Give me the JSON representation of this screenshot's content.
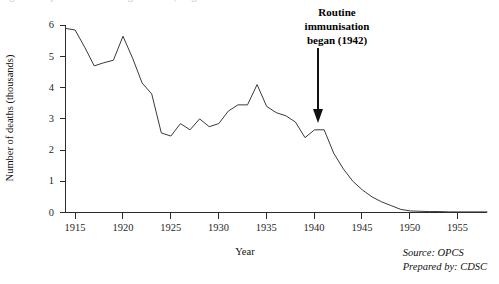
{
  "figure": {
    "clipped_top_caption": "Figure 1   Diphtheria: death registrations, England and Wales",
    "annotation": {
      "line1": "Routine",
      "line2": "immunisation",
      "line3": "began (1942)"
    },
    "source": {
      "line1": "Source: OPCS",
      "line2": "Prepared by: CDSC"
    },
    "colors": {
      "line": "#3a3a3a",
      "axis": "#2b2b2b",
      "text": "#111111",
      "background": "#ffffff"
    }
  },
  "chart_data": {
    "type": "line",
    "title": "",
    "xlabel": "Year",
    "ylabel": "Number of deaths (thousands)",
    "xlim": [
      1914,
      1958
    ],
    "ylim": [
      0,
      6
    ],
    "grid": false,
    "legend": "none",
    "xticks": [
      1915,
      1920,
      1925,
      1930,
      1935,
      1940,
      1945,
      1950,
      1955
    ],
    "xtick_labels": [
      "1915",
      "1920",
      "1925",
      "1930",
      "1935",
      "1940",
      "1945",
      "1950",
      "1955"
    ],
    "yticks": [
      0,
      1,
      2,
      3,
      4,
      5,
      6
    ],
    "ytick_labels": [
      "0",
      "1",
      "2",
      "3",
      "4",
      "5",
      "6"
    ],
    "series": [
      {
        "name": "Deaths from diphtheria",
        "x": [
          1914,
          1915,
          1916,
          1917,
          1918,
          1919,
          1920,
          1921,
          1922,
          1923,
          1924,
          1925,
          1926,
          1927,
          1928,
          1929,
          1930,
          1931,
          1932,
          1933,
          1934,
          1935,
          1936,
          1937,
          1938,
          1939,
          1940,
          1941,
          1942,
          1943,
          1944,
          1945,
          1946,
          1947,
          1948,
          1949,
          1950,
          1951,
          1952,
          1953,
          1954,
          1955,
          1956,
          1957,
          1958
        ],
        "values": [
          5.9,
          5.85,
          5.3,
          4.7,
          4.8,
          4.88,
          5.65,
          4.95,
          4.15,
          3.8,
          2.55,
          2.45,
          2.85,
          2.65,
          3.0,
          2.75,
          2.85,
          3.25,
          3.45,
          3.45,
          4.1,
          3.4,
          3.2,
          3.1,
          2.9,
          2.4,
          2.65,
          2.65,
          1.9,
          1.4,
          1.0,
          0.72,
          0.5,
          0.34,
          0.22,
          0.1,
          0.05,
          0.04,
          0.03,
          0.03,
          0.02,
          0.02,
          0.02,
          0.02,
          0.02
        ]
      }
    ],
    "annotations": [
      {
        "text": "Routine immunisation began (1942)",
        "x": 1942,
        "arrow": true,
        "arrow_from_y": 5.8,
        "arrow_to_y": 3.0
      }
    ]
  }
}
